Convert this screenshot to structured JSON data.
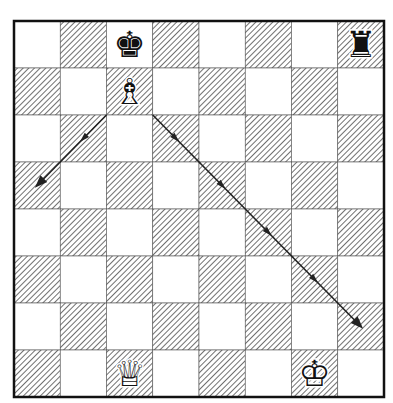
{
  "diagram": {
    "type": "chess-position",
    "files": [
      "a",
      "b",
      "c",
      "d",
      "e",
      "f",
      "g",
      "h"
    ],
    "ranks": [
      8,
      7,
      6,
      5,
      4,
      3,
      2,
      1
    ],
    "colors": {
      "light_square": "#ffffff",
      "dark_hatch": "#333333",
      "border": "#111111",
      "arrow": "#222222"
    },
    "pieces": [
      {
        "square": "c8",
        "piece": "king",
        "color": "black",
        "glyph": "♚"
      },
      {
        "square": "h8",
        "piece": "rook",
        "color": "black",
        "glyph": "♜"
      },
      {
        "square": "c7",
        "piece": "bishop",
        "color": "white",
        "glyph": "♗"
      },
      {
        "square": "c1",
        "piece": "queen",
        "color": "white",
        "glyph": "♕"
      },
      {
        "square": "g1",
        "piece": "king",
        "color": "white",
        "glyph": "♔"
      }
    ],
    "arrows": [
      {
        "from": "c7",
        "to": "a5",
        "style": "line-with-midpoint-arrows"
      },
      {
        "from": "c7",
        "to": "h2",
        "style": "line-with-midpoint-arrows"
      }
    ]
  }
}
